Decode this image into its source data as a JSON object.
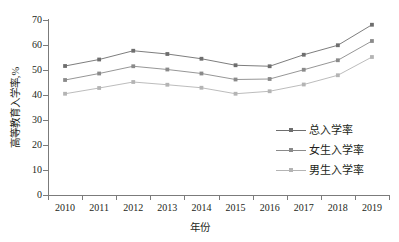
{
  "chart_data": {
    "type": "line",
    "title": "",
    "xlabel": "年份",
    "ylabel": "高等教育入学率,%",
    "categories": [
      "2010",
      "2011",
      "2012",
      "2013",
      "2014",
      "2015",
      "2016",
      "2017",
      "2018",
      "2019"
    ],
    "x": [
      2010,
      2011,
      2012,
      2013,
      2014,
      2015,
      2016,
      2017,
      2018,
      2019
    ],
    "xlim": [
      2009.5,
      2019.5
    ],
    "ylim": [
      0,
      70
    ],
    "yticks": [
      0,
      10,
      20,
      30,
      40,
      50,
      60,
      70
    ],
    "grid": false,
    "legend_position": "center-right",
    "series": [
      {
        "name": "总入学率",
        "color": "#6e6e6e",
        "marker": "square",
        "values": [
          51.6,
          54.2,
          57.7,
          56.4,
          54.5,
          51.9,
          51.5,
          56.1,
          59.9,
          68.1
        ]
      },
      {
        "name": "女生入学率",
        "color": "#8a8a8a",
        "marker": "square",
        "values": [
          46.0,
          48.6,
          51.5,
          50.2,
          48.6,
          46.2,
          46.4,
          50.1,
          53.9,
          61.6
        ]
      },
      {
        "name": "男生入学率",
        "color": "#b4b4b4",
        "marker": "square",
        "values": [
          40.5,
          42.8,
          45.2,
          44.1,
          42.9,
          40.5,
          41.5,
          44.2,
          47.9,
          55.2
        ]
      }
    ]
  },
  "axis": {
    "y_tick_labels": [
      "0",
      "10",
      "20",
      "30",
      "40",
      "50",
      "60",
      "70"
    ],
    "x_tick_labels": [
      "2010",
      "2011",
      "2012",
      "2013",
      "2014",
      "2015",
      "2016",
      "2017",
      "2018",
      "2019"
    ],
    "x_title": "年份",
    "y_title": "高等教育入学率,%"
  },
  "legend": {
    "items": [
      {
        "label": "总入学率"
      },
      {
        "label": "女生入学率"
      },
      {
        "label": "男生入学率"
      }
    ]
  },
  "colors": {
    "axis": "#7b7b7b",
    "text": "#231f20",
    "series_total": "#6e6e6e",
    "series_female": "#8a8a8a",
    "series_male": "#b4b4b4",
    "background": "#ffffff"
  }
}
